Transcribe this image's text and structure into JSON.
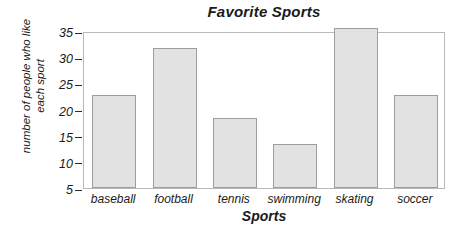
{
  "chart_data": {
    "type": "bar",
    "title": "Favorite Sports",
    "xlabel": "Sports",
    "ylabel": "number of people who like\neach sport",
    "categories": [
      "baseball",
      "football",
      "tennis",
      "swimming",
      "skating",
      "soccer"
    ],
    "values": [
      22.7,
      31.8,
      18.4,
      13.5,
      35.5,
      22.8
    ],
    "ylim": [
      5,
      35
    ],
    "yticks": [
      5,
      10,
      15,
      20,
      25,
      30,
      35
    ],
    "ytick_labels": [
      "5",
      "10",
      "15",
      "20",
      "25",
      "30",
      "35"
    ],
    "grid": false,
    "legend": "none",
    "bar_fill_color": "#e2e2e2",
    "bar_border_color": "#9d9d9d",
    "frame_color": "#b9b9b9",
    "background_color": "#ffffff",
    "text_color": "#1a1a1a"
  }
}
